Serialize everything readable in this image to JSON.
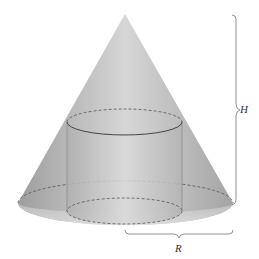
{
  "diagram": {
    "labels": {
      "height": "H",
      "radius": "R"
    },
    "colors": {
      "cone_fill": "#b8b8b8",
      "cone_highlight": "#d4d4d4",
      "cylinder_fill": "#c2c2c2",
      "line": "#555555",
      "brace": "#777777"
    }
  }
}
